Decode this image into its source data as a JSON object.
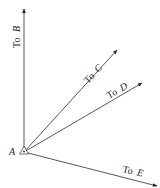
{
  "diagram": {
    "origin": {
      "label": "A",
      "x": 24,
      "y": 152
    },
    "rays": [
      {
        "id": "B",
        "prefix": "To",
        "target": "B",
        "x2": 24,
        "y2": 8
      },
      {
        "id": "C",
        "prefix": "To",
        "target": "C",
        "x2": 117,
        "y2": 50
      },
      {
        "id": "D",
        "prefix": "To",
        "target": "D",
        "x2": 142,
        "y2": 83
      },
      {
        "id": "E",
        "prefix": "To",
        "target": "E",
        "x2": 157,
        "y2": 186
      }
    ],
    "colors": {
      "line": "#333333",
      "background": "#ffffff"
    }
  }
}
